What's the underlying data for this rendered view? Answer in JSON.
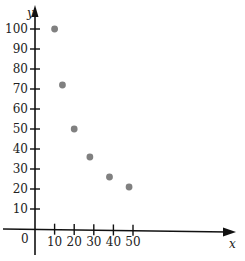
{
  "chart_data": {
    "type": "scatter",
    "title": "",
    "xlabel": "x",
    "ylabel": "y",
    "origin_label": "0",
    "x": [
      10,
      14,
      20,
      28,
      38,
      48
    ],
    "y": [
      100,
      72,
      50,
      36,
      26,
      21
    ],
    "series": [
      {
        "name": "points",
        "x": [
          10,
          14,
          20,
          28,
          38,
          48
        ],
        "y": [
          100,
          72,
          50,
          36,
          26,
          21
        ],
        "color": "#808080"
      }
    ],
    "xticks": [
      10,
      20,
      30,
      40,
      50
    ],
    "yticks": [
      10,
      20,
      30,
      40,
      50,
      60,
      70,
      80,
      90,
      100
    ],
    "xlim": [
      0,
      100
    ],
    "ylim": [
      0,
      110
    ],
    "grid": false,
    "legend": null
  },
  "labels": {
    "x_axis": "x",
    "y_axis": "y",
    "origin": "0"
  },
  "colors": {
    "axis": "#111111",
    "point": "#808080"
  }
}
